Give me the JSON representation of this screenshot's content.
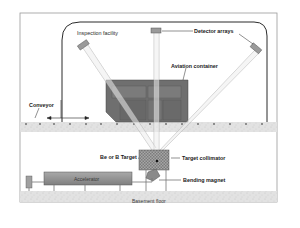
{
  "diagram": {
    "labels": {
      "facility": "Inspection facility",
      "detectors": "Detector arrays",
      "container": "Aviation container",
      "conveyor": "Conveyor",
      "target": "Be or B Target",
      "collimator": "Target collimator",
      "magnet": "Bending magnet",
      "accelerator": "Accelerator",
      "floor": "Basement floor"
    },
    "colors": {
      "frame": "#9a9a9a",
      "facility_outline": "#2b2b2b",
      "container": "#6f6f6f",
      "container_dark": "#565656",
      "accelerator": "#8c8c8c",
      "floor": "#dcdcdc",
      "beam": "#e9e9e9"
    }
  }
}
